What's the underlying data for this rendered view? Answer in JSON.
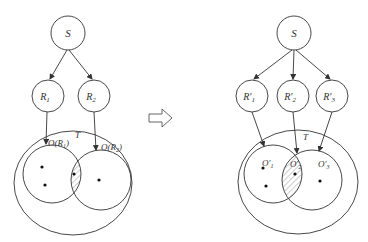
{
  "colors": {
    "stroke": "#333333",
    "hatch": "#9a9a9a",
    "background": "#ffffff"
  },
  "left": {
    "source": "S",
    "routers": [
      "R",
      "R"
    ],
    "router_subs": [
      "1",
      "2"
    ],
    "target": "T",
    "sets": [
      "O(R",
      "O(R"
    ],
    "set_subs": [
      "1",
      "2"
    ],
    "set_close": ")"
  },
  "transition_arrow": "hollow-right-arrow-icon",
  "right": {
    "source": "S",
    "routers": [
      "R'",
      "R'",
      "R'"
    ],
    "router_subs": [
      "1",
      "2",
      "3"
    ],
    "target": "T",
    "sets": [
      "O'",
      "O'",
      "O'"
    ],
    "set_subs": [
      "1",
      "2",
      "3"
    ]
  }
}
